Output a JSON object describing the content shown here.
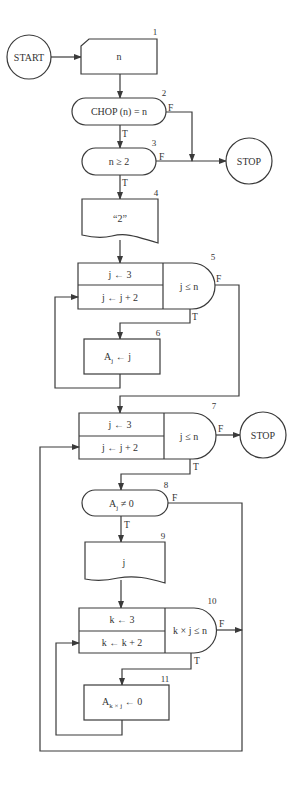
{
  "flowchart": {
    "start": {
      "label": "START"
    },
    "stop_top": {
      "label": "STOP"
    },
    "stop_mid": {
      "label": "STOP"
    },
    "nodes": [
      {
        "id": "1",
        "type": "manual-input",
        "text": "n"
      },
      {
        "id": "2",
        "type": "decision-oval",
        "text": "CHOP (n)  =  n",
        "true": "T",
        "false": "F"
      },
      {
        "id": "3",
        "type": "decision-oval",
        "text": "n  ≥  2",
        "true": "T",
        "false": "F"
      },
      {
        "id": "4",
        "type": "document-output",
        "text": "“2”"
      },
      {
        "id": "5",
        "type": "loop",
        "init": "j ← 3",
        "increment": "j ← j + 2",
        "condition": "j  ≤  n",
        "true": "T",
        "false": "F"
      },
      {
        "id": "6",
        "type": "process",
        "text_main": "A",
        "text_sub": "j",
        "text_rest": " ← j"
      },
      {
        "id": "7",
        "type": "loop",
        "init": "j ← 3",
        "increment": "j ← j + 2",
        "condition": "j ≤ n",
        "true": "T",
        "false": "F"
      },
      {
        "id": "8",
        "type": "decision-oval",
        "text_main": "A",
        "text_sub": "j",
        "text_rest": " ≠ 0",
        "true": "T",
        "false": "F"
      },
      {
        "id": "9",
        "type": "document-output",
        "text": "j"
      },
      {
        "id": "10",
        "type": "loop",
        "init": "k ← 3",
        "increment": "k ← k + 2",
        "condition": "k × j ≤ n",
        "true": "T",
        "false": "F"
      },
      {
        "id": "11",
        "type": "process",
        "text_main": "A",
        "text_sub": "k × j",
        "text_rest": " ← 0"
      }
    ]
  }
}
